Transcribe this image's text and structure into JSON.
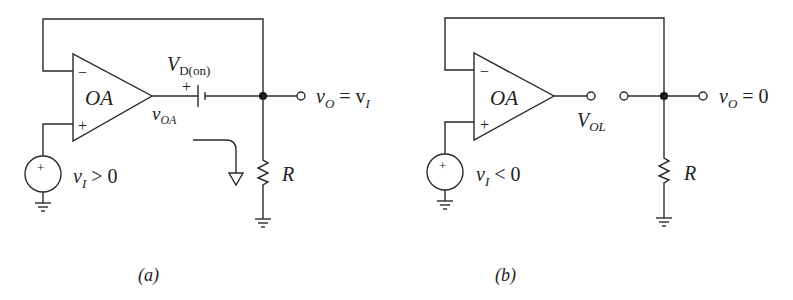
{
  "figure": {
    "type": "op-amp precision rectifier circuit diagrams",
    "colors": {
      "stroke": "#2a2a2a",
      "text": "#222222",
      "background": "#ffffff"
    }
  },
  "panel_a": {
    "caption": "(a)",
    "opamp_label": "OA",
    "inverting_sign": "−",
    "noninverting_sign": "+",
    "source_sign": "+",
    "source_label_var": "v",
    "source_label_sub": "I",
    "source_label_rel": " > 0",
    "diode_label_main": "V",
    "diode_label_sub": "D(on)",
    "diode_plus": "+",
    "opamp_out_var": "v",
    "opamp_out_sub": "OA",
    "output_var": "v",
    "output_sub": "O",
    "output_eq": " = v",
    "output_eq_sub": "I",
    "resistor_label": "R"
  },
  "panel_b": {
    "caption": "(b)",
    "opamp_label": "OA",
    "inverting_sign": "−",
    "noninverting_sign": "+",
    "source_sign": "+",
    "source_label_var": "v",
    "source_label_sub": "I",
    "source_label_rel": " < 0",
    "opamp_out_main": "V",
    "opamp_out_sub": "OL",
    "output_var": "v",
    "output_sub": "O",
    "output_eq": " = 0",
    "resistor_label": "R"
  }
}
